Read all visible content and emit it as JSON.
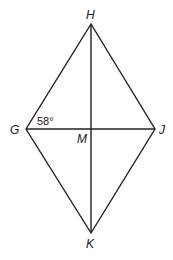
{
  "diagram": {
    "type": "rhombus-with-diagonals",
    "vertices": {
      "H": {
        "label": "H",
        "x": 91,
        "y": 24
      },
      "G": {
        "label": "G",
        "x": 26,
        "y": 129
      },
      "J": {
        "label": "J",
        "x": 155,
        "y": 129
      },
      "K": {
        "label": "K",
        "x": 91,
        "y": 233
      },
      "M": {
        "label": "M",
        "x": 91,
        "y": 129
      }
    },
    "angle_label": "58°",
    "stroke_color": "#222222"
  }
}
